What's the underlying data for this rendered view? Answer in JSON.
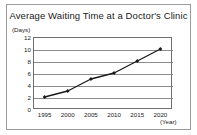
{
  "chart_data": {
    "type": "line",
    "title": "Average Waiting Time at a Doctor's Clinic",
    "xlabel": "(Year)",
    "ylabel": "(Days)",
    "categories": [
      "1995",
      "2000",
      "2005",
      "2010",
      "2015",
      "2020"
    ],
    "x": [
      1995,
      2000,
      2005,
      2010,
      2015,
      2020
    ],
    "values": [
      2,
      3,
      5,
      6,
      8,
      10
    ],
    "series": [
      {
        "name": "Average waiting time",
        "values": [
          2,
          3,
          5,
          6,
          8,
          10
        ]
      }
    ],
    "ylim": [
      0,
      12
    ],
    "yticks": [
      "0",
      "2",
      "4",
      "6",
      "8",
      "10",
      "12"
    ],
    "ytick_values": [
      0,
      2,
      4,
      6,
      8,
      10,
      12
    ],
    "xticks": [
      "1995",
      "2000",
      "2005",
      "2010",
      "2015",
      "2020"
    ],
    "grid": "horizontal",
    "legend": "none",
    "marker": "filled-diamond",
    "line_color": "#1a1a1a",
    "grid_color": "#8c8c8c",
    "frame_color": "#6f6f6f",
    "background": "#ffffff"
  }
}
